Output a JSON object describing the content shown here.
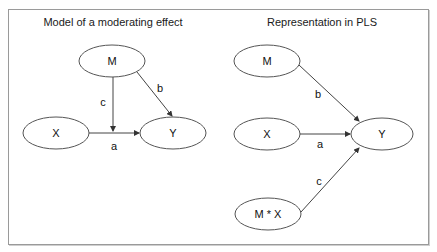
{
  "left_panel": {
    "title": "Model of a moderating effect",
    "nodes": {
      "m": "M",
      "x": "X",
      "y": "Y"
    },
    "edges": {
      "mx_to_path": "c",
      "m_to_y": "b",
      "x_to_y": "a"
    }
  },
  "right_panel": {
    "title": "Representation in PLS",
    "nodes": {
      "m": "M",
      "x": "X",
      "y": "Y",
      "mx": "M * X"
    },
    "edges": {
      "m_to_y": "b",
      "x_to_y": "a",
      "mx_to_y": "c"
    }
  },
  "colors": {
    "stroke": "#555555",
    "border": "#9a9a9a"
  }
}
